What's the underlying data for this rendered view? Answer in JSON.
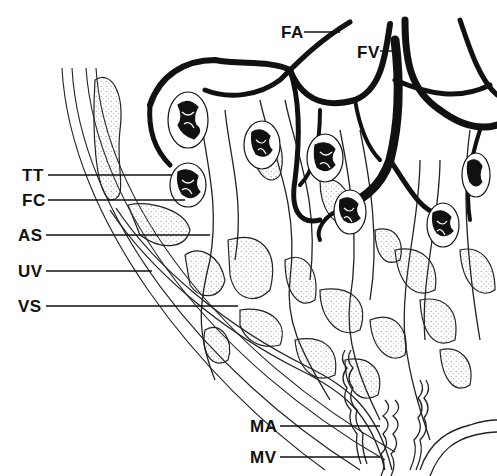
{
  "diagram": {
    "type": "anatomical line drawing (placental vasculature cross-section)",
    "labels": [
      {
        "id": "FA",
        "text": "FA",
        "x": 281,
        "y": 24,
        "line_to": [
          340,
          32
        ]
      },
      {
        "id": "FV",
        "text": "FV",
        "x": 357,
        "y": 44,
        "line_to": [
          392,
          50
        ]
      },
      {
        "id": "TT",
        "text": "TT",
        "x": 24,
        "y": 166,
        "line_to": [
          172,
          175
        ]
      },
      {
        "id": "FC",
        "text": "FC",
        "x": 24,
        "y": 192,
        "line_to": [
          180,
          200
        ]
      },
      {
        "id": "AS",
        "text": "AS",
        "x": 20,
        "y": 227,
        "line_to": [
          210,
          235
        ]
      },
      {
        "id": "UV",
        "text": "UV",
        "x": 20,
        "y": 263,
        "line_to": [
          152,
          271
        ]
      },
      {
        "id": "VS",
        "text": "VS",
        "x": 20,
        "y": 298,
        "line_to": [
          238,
          306
        ]
      },
      {
        "id": "MA",
        "text": "MA",
        "x": 252,
        "y": 418,
        "line_to": [
          380,
          426
        ]
      },
      {
        "id": "MV",
        "text": "MV",
        "x": 252,
        "y": 449,
        "line_to": [
          380,
          457
        ]
      }
    ]
  }
}
